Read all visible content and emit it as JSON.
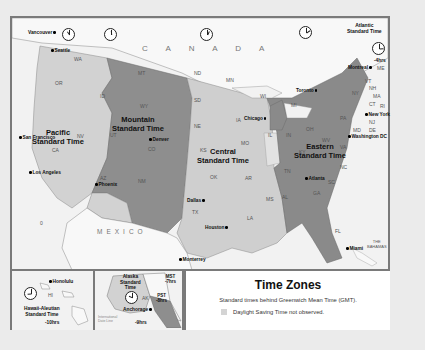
{
  "legend": {
    "title": "Time Zones",
    "subtitle": "Standard times behind Greenwich Mean Time (GMT).",
    "key_label": "Daylight Saving Time not observed."
  },
  "colors": {
    "pacific": "#d2d2d2",
    "mountain": "#8e8e8e",
    "central": "#cfcfcf",
    "eastern": "#8a8a8a",
    "canada_mexico": "#f7f7f7",
    "water": "#f2f2f2",
    "no_dst": "#d4d4d4",
    "border": "#7a7a7a"
  },
  "zones": {
    "pacific": "Pacific\nStandard Time",
    "mountain": "Mountain\nStandard Time",
    "central": "Central\nStandard Time",
    "eastern": "Eastern\nStandard Time",
    "atlantic": "Atlantic\nStandard Time",
    "atlantic_offset": "-4hrs",
    "alaska": "Alaska\nStandard\nTime",
    "alaska_offset": "-9hrs",
    "hawaii": "Hawaii-Aleutian\nStandard Time",
    "hawaii_offset": "-10hrs",
    "mst": "MST\n-7hrs",
    "pst": "PST\n-8hrs"
  },
  "countries": {
    "canada": "C A N A D A",
    "mexico": "MEXICO",
    "bahamas": "THE\nBAHAMAS"
  },
  "cities": {
    "vancouver": "Vancouver",
    "seattle": "Seattle",
    "san_francisco": "San Francisco",
    "los_angeles": "Los Angeles",
    "phoenix": "Phoenix",
    "denver": "Denver",
    "dallas": "Dallas",
    "houston": "Houston",
    "monterrey": "Monterrey",
    "chicago": "Chicago",
    "toronto": "Toronto",
    "montreal": "Montreal",
    "new_york": "New York",
    "washington": "Washington DC",
    "atlanta": "Atlanta",
    "miami": "Miami",
    "honolulu": "Honolulu",
    "anchorage": "Anchorage"
  },
  "states": {
    "WA": "WA",
    "OR": "OR",
    "CA": "CA",
    "NV": "NV",
    "ID": "ID",
    "MT": "MT",
    "WY": "WY",
    "UT": "UT",
    "CO": "CO",
    "AZ": "AZ",
    "NM": "NM",
    "ND": "ND",
    "SD": "SD",
    "NE": "NE",
    "KS": "KS",
    "OK": "OK",
    "TX": "TX",
    "MN": "MN",
    "IA": "IA",
    "MO": "MO",
    "AR": "AR",
    "LA": "LA",
    "WI": "WI",
    "IL": "IL",
    "MS": "MS",
    "AL": "AL",
    "TN": "TN",
    "KY": "KY",
    "IN": "IN",
    "MI": "MI",
    "OH": "OH",
    "WV": "WV",
    "VA": "VA",
    "NC": "NC",
    "SC": "SC",
    "GA": "GA",
    "FL": "FL",
    "PA": "PA",
    "NY": "NY",
    "VT": "VT",
    "NH": "NH",
    "ME": "ME",
    "MA": "MA",
    "CT": "CT",
    "RI": "RI",
    "NJ": "NJ",
    "DE": "DE",
    "MD": "MD",
    "HI": "HI",
    "AK": "AK"
  },
  "misc": {
    "dateline": "International\nDate Line",
    "ocean_zero": "0"
  }
}
